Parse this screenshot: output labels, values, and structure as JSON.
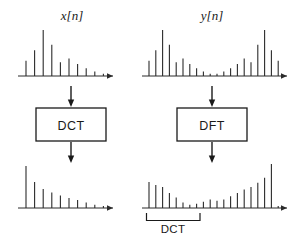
{
  "figure": {
    "stroke_color": "#2b2b2b",
    "background": "#ffffff"
  },
  "labels": {
    "input_signal": "x[n]",
    "mirrored_signal": "y[n]",
    "dct_box": "DCT",
    "dft_box": "DFT",
    "bracket": "DCT"
  },
  "chart_data": [
    {
      "id": "x-of-n",
      "type": "stem",
      "title": "x[n]",
      "xlabel": "",
      "ylabel": "",
      "grid": false,
      "axis_arrow": true,
      "n": [
        0,
        1,
        2,
        3,
        4,
        5,
        6,
        7,
        8,
        9
      ],
      "values": [
        0.33,
        0.56,
        1.0,
        0.68,
        0.3,
        0.38,
        0.26,
        0.17,
        0.1,
        0.05
      ]
    },
    {
      "id": "y-of-n",
      "type": "stem",
      "title": "y[n]",
      "xlabel": "",
      "ylabel": "",
      "grid": false,
      "axis_arrow": true,
      "n": [
        0,
        1,
        2,
        3,
        4,
        5,
        6,
        7,
        8,
        9,
        10,
        11,
        12,
        13,
        14,
        15,
        16,
        17,
        18,
        19
      ],
      "values": [
        0.33,
        0.56,
        1.0,
        0.68,
        0.3,
        0.38,
        0.26,
        0.17,
        0.1,
        0.05,
        0.05,
        0.1,
        0.17,
        0.26,
        0.38,
        0.3,
        0.68,
        1.0,
        0.56,
        0.33
      ]
    },
    {
      "id": "dct-output",
      "type": "stem",
      "title": "",
      "xlabel": "",
      "ylabel": "",
      "grid": false,
      "axis_arrow": true,
      "n": [
        0,
        1,
        2,
        3,
        4,
        5,
        6,
        7,
        8,
        9
      ],
      "values": [
        1.0,
        0.62,
        0.45,
        0.37,
        0.3,
        0.24,
        0.19,
        0.13,
        0.08,
        0.05
      ]
    },
    {
      "id": "dft-output",
      "type": "stem",
      "title": "",
      "xlabel": "",
      "ylabel": "",
      "grid": false,
      "axis_arrow": true,
      "annotation": "DCT",
      "annotation_span_n": [
        0,
        9
      ],
      "n": [
        0,
        1,
        2,
        3,
        4,
        5,
        6,
        7,
        8,
        9,
        10,
        11,
        12,
        13,
        14,
        15,
        16,
        17,
        18,
        19
      ],
      "values": [
        0.62,
        0.55,
        0.5,
        0.36,
        0.25,
        0.13,
        0.08,
        0.1,
        0.15,
        0.2,
        0.17,
        0.2,
        0.28,
        0.36,
        0.44,
        0.5,
        0.6,
        0.72,
        1.05,
        0.05
      ]
    }
  ]
}
